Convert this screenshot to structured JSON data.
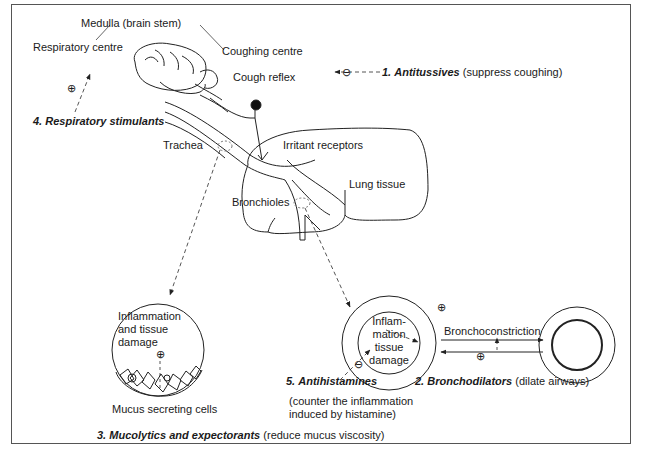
{
  "diagram": {
    "labels": {
      "medulla": "Medulla (brain stem)",
      "respiratory_centre": "Respiratory centre",
      "coughing_centre": "Coughing centre",
      "cough_reflex": "Cough reflex",
      "trachea": "Trachea",
      "irritant_receptors": "Irritant receptors",
      "lung_tissue": "Lung tissue",
      "bronchioles": "Bronchioles",
      "inflammation_left_1": "Inflammation",
      "inflammation_left_2": "and tissue",
      "inflammation_left_3": "damage",
      "mucus_cells": "Mucus secreting cells",
      "inflammation_right_1": "Inflam-",
      "inflammation_right_2": "mation",
      "inflammation_right_3": "tissue",
      "inflammation_right_4": "damage",
      "bronchoconstriction": "Bronchoconstriction"
    },
    "drugs": [
      {
        "number": "1.",
        "name": "Antitussives",
        "effect": "(suppress coughing)",
        "sign": "⊖"
      },
      {
        "number": "2.",
        "name": "Bronchodilators",
        "effect": "(dilate airways)",
        "sign": "⊕"
      },
      {
        "number": "3.",
        "name": "Mucolytics and expectorants",
        "effect": "(reduce mucus viscosity)",
        "sign": ""
      },
      {
        "number": "4.",
        "name": "Respiratory stimulants",
        "effect": "",
        "sign": "⊕"
      },
      {
        "number": "5.",
        "name": "Antihistamines",
        "effect_line1": "(counter the inflammation",
        "effect_line2": "induced by histamine)",
        "sign": "⊖"
      }
    ],
    "signs": {
      "plus": "⊕",
      "minus": "⊖"
    }
  }
}
